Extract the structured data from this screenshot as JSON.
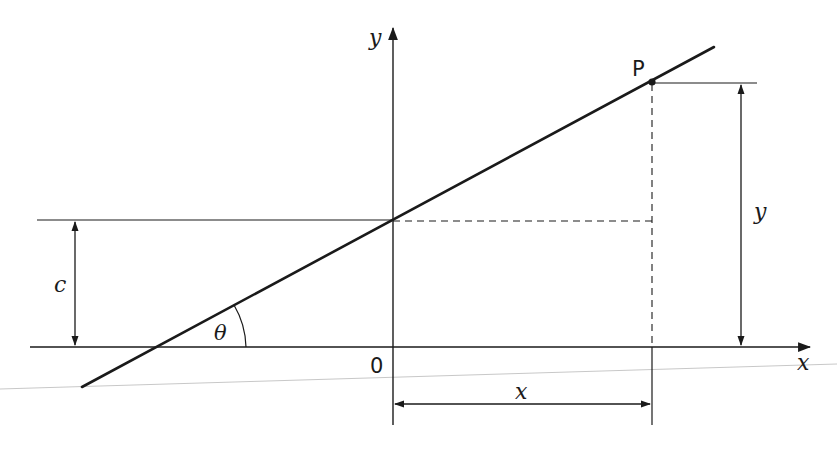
{
  "diagram": {
    "colors": {
      "background": "#ffffff",
      "ink": "#1a1a1a",
      "faint_line": "#c8c8c8"
    },
    "axes": {
      "x_label": "x",
      "y_label": "y",
      "origin_label": "0"
    },
    "point": {
      "label": "P"
    },
    "dimensions": {
      "intercept_label": "c",
      "vertical_distance_label": "y",
      "horizontal_distance_label": "x",
      "angle_label": "θ"
    }
  }
}
